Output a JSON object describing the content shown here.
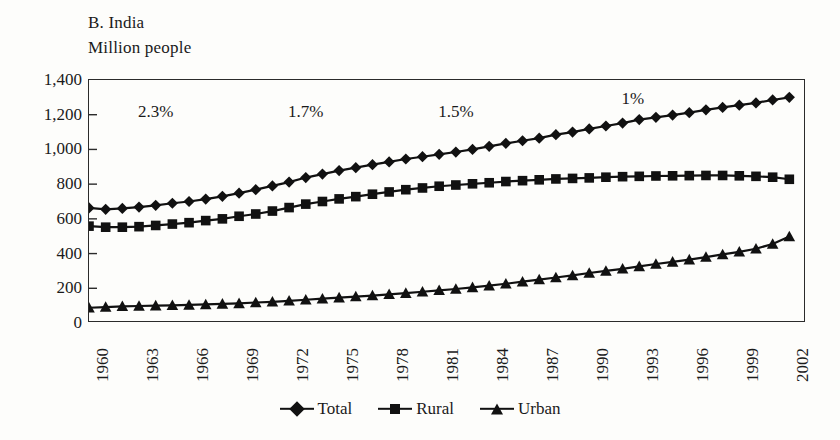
{
  "figure": {
    "title": "B. India",
    "subtitle": "Million people"
  },
  "legend": {
    "position": "bottom-center",
    "items": [
      {
        "label": "Total",
        "marker": "diamond-icon"
      },
      {
        "label": "Rural",
        "marker": "square-icon"
      },
      {
        "label": "Urban",
        "marker": "triangle-icon"
      }
    ]
  },
  "annotations": [
    {
      "text": "2.3%",
      "x_year": 1963,
      "y_value": 1215
    },
    {
      "text": "1.7%",
      "x_year": 1972,
      "y_value": 1215
    },
    {
      "text": "1.5%",
      "x_year": 1981,
      "y_value": 1215
    },
    {
      "text": "1%",
      "x_year": 1992,
      "y_value": 1290
    }
  ],
  "chart_data": {
    "type": "line",
    "title": "B. India",
    "subtitle": "Million people",
    "xlabel": "",
    "ylabel": "Million people",
    "xlim": [
      1960,
      2003
    ],
    "ylim": [
      0,
      1400
    ],
    "ytick_step": 200,
    "yticks": [
      0,
      200,
      400,
      600,
      800,
      1000,
      1200,
      1400
    ],
    "ytick_labels": [
      "0",
      "200",
      "400",
      "600",
      "800",
      "1,000",
      "1,200",
      "1,400"
    ],
    "xticks": [
      1960,
      1963,
      1966,
      1969,
      1972,
      1975,
      1978,
      1981,
      1984,
      1987,
      1990,
      1993,
      1996,
      1999,
      2002
    ],
    "xtick_labels": [
      "1960",
      "1963",
      "1966",
      "1969",
      "1972",
      "1975",
      "1978",
      "1981",
      "1984",
      "1987",
      "1990",
      "1993",
      "1996",
      "1999",
      "2002"
    ],
    "xtick_rotation": 90,
    "grid": false,
    "x": [
      1960,
      1961,
      1962,
      1963,
      1964,
      1965,
      1966,
      1967,
      1968,
      1969,
      1970,
      1971,
      1972,
      1973,
      1974,
      1975,
      1976,
      1977,
      1978,
      1979,
      1980,
      1981,
      1982,
      1983,
      1984,
      1985,
      1986,
      1987,
      1988,
      1989,
      1990,
      1991,
      1992,
      1993,
      1994,
      1995,
      1996,
      1997,
      1998,
      1999,
      2000,
      2001,
      2002
    ],
    "series": [
      {
        "name": "Total",
        "marker": "diamond",
        "values": [
          663,
          655,
          660,
          668,
          678,
          690,
          700,
          714,
          730,
          748,
          768,
          790,
          812,
          838,
          858,
          878,
          895,
          912,
          928,
          945,
          958,
          972,
          985,
          1000,
          1018,
          1035,
          1050,
          1065,
          1085,
          1100,
          1118,
          1135,
          1152,
          1172,
          1185,
          1198,
          1212,
          1228,
          1242,
          1255,
          1268,
          1285,
          1300
        ]
      },
      {
        "name": "Rural",
        "marker": "square",
        "values": [
          558,
          552,
          552,
          555,
          562,
          570,
          578,
          590,
          600,
          615,
          628,
          645,
          665,
          685,
          700,
          715,
          728,
          742,
          755,
          768,
          778,
          788,
          795,
          802,
          808,
          815,
          820,
          825,
          830,
          833,
          836,
          840,
          843,
          845,
          847,
          848,
          849,
          850,
          850,
          848,
          845,
          840,
          828
        ]
      },
      {
        "name": "Urban",
        "marker": "triangle",
        "values": [
          88,
          92,
          96,
          98,
          100,
          102,
          104,
          107,
          110,
          113,
          118,
          122,
          128,
          134,
          140,
          146,
          152,
          158,
          165,
          172,
          180,
          188,
          196,
          205,
          215,
          226,
          238,
          250,
          262,
          274,
          288,
          300,
          312,
          326,
          340,
          352,
          365,
          380,
          395,
          410,
          428,
          455,
          498
        ]
      }
    ]
  }
}
